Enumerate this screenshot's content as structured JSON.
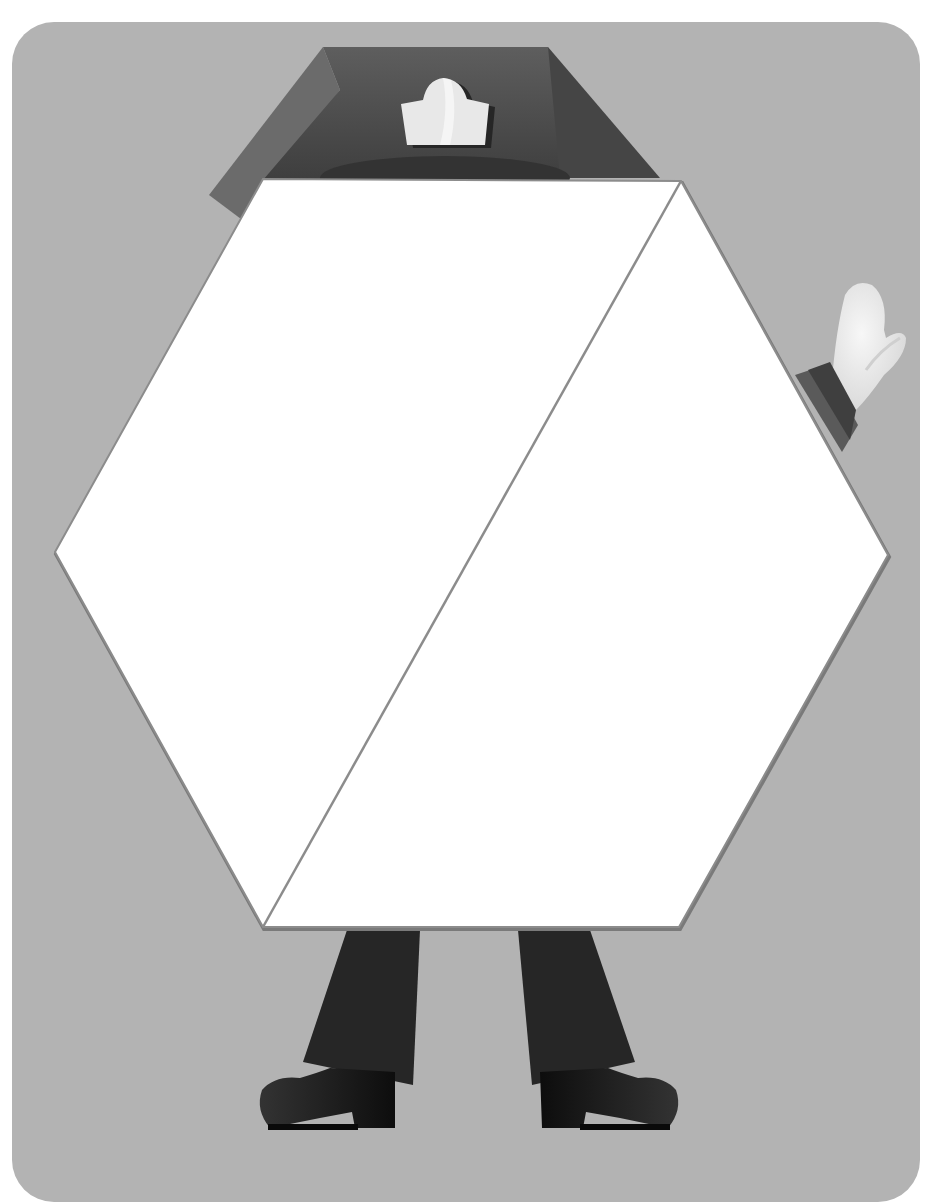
{
  "scene": {
    "description": "Hexagon-shaped character with sailor cap, waving white glove, dark trousers and shoes",
    "colors": {
      "background": "#ffffff",
      "card": "#b3b3b3",
      "hexagon_fill": "#ffffff",
      "hexagon_stroke": "#8c8c8c",
      "cap_dark": "#4a4a4a",
      "cap_mid": "#5c5c5c",
      "cap_light": "#6e6e6e",
      "badge": "#e6e6e6",
      "glove": "#ebebeb",
      "cuff_dark": "#4d4d4d",
      "cuff_mid": "#666666",
      "trousers": "#262626",
      "shoes": "#1a1a1a"
    },
    "hexagon": {
      "vertices": [
        [
          263,
          179
        ],
        [
          681,
          181
        ],
        [
          888,
          555
        ],
        [
          679,
          927
        ],
        [
          263,
          927
        ],
        [
          55,
          552
        ]
      ],
      "divider": [
        [
          681,
          181
        ],
        [
          263,
          927
        ]
      ]
    }
  }
}
